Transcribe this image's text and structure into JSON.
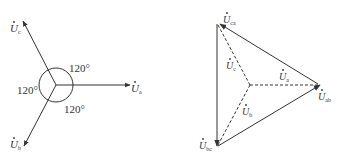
{
  "left_diagram": {
    "title": "Star (Y) phasor diagram",
    "phasors": [
      {
        "id": "a",
        "label": "U",
        "sub": "a",
        "direction_deg": 0
      },
      {
        "id": "b",
        "label": "U",
        "sub": "b",
        "direction_deg": -120
      },
      {
        "id": "c",
        "label": "U",
        "sub": "c",
        "direction_deg": 120
      }
    ],
    "angles": [
      "120°",
      "120°",
      "120°"
    ]
  },
  "right_diagram": {
    "title": "Line voltage triangle",
    "vertices": [
      {
        "id": "ca",
        "label": "U",
        "sub": "ca"
      },
      {
        "id": "ab",
        "label": "U",
        "sub": "ab"
      },
      {
        "id": "bc",
        "label": "U",
        "sub": "bc"
      }
    ],
    "inner_phasors": [
      {
        "id": "c",
        "label": "U",
        "sub": "c"
      },
      {
        "id": "a",
        "label": "U",
        "sub": "a"
      },
      {
        "id": "b",
        "label": "U",
        "sub": "b"
      }
    ]
  },
  "colors": {
    "line": "#333333",
    "background": "#ffffff"
  }
}
